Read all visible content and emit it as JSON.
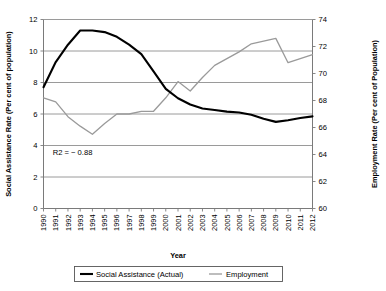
{
  "chart_data": {
    "type": "line",
    "title": "",
    "xlabel": "Year",
    "ylabel": "Social Assistance Rate (Per cent of population)",
    "y2label": "Employment Rate (Per cent of Population)",
    "categories": [
      "1990",
      "1991",
      "1992",
      "1993",
      "1994",
      "1995",
      "1996",
      "1997",
      "1998",
      "1999",
      "2000",
      "2001",
      "2002",
      "2003",
      "2004",
      "2005",
      "2006",
      "2007",
      "2008",
      "2009",
      "2010",
      "2011",
      "2012"
    ],
    "ylim": [
      0,
      12
    ],
    "yticks": [
      0,
      2,
      4,
      6,
      8,
      10,
      12
    ],
    "y2lim": [
      60,
      74
    ],
    "y2ticks": [
      60,
      62,
      64,
      66,
      68,
      70,
      72,
      74
    ],
    "grid": true,
    "legend_position": "bottom",
    "annotations": [
      {
        "text": "R2 = − 0.88",
        "x": "1991",
        "y": 3.6
      }
    ],
    "series": [
      {
        "name": "Social Assistance (Actual)",
        "axis": "left",
        "color": "#000000",
        "values": [
          7.7,
          9.3,
          10.4,
          11.3,
          11.3,
          11.2,
          10.9,
          10.4,
          9.8,
          8.7,
          7.6,
          7.0,
          6.6,
          6.35,
          6.25,
          6.15,
          6.1,
          5.95,
          5.7,
          5.5,
          5.6,
          5.75,
          5.85
        ]
      },
      {
        "name": "Employment",
        "axis": "right",
        "color": "#9a9a9a",
        "values": [
          68.2,
          67.9,
          66.8,
          66.1,
          65.5,
          66.3,
          67.0,
          67.0,
          67.2,
          67.2,
          68.2,
          69.4,
          68.7,
          69.7,
          70.6,
          71.1,
          71.6,
          72.2,
          72.4,
          72.6,
          70.8,
          71.1,
          71.4
        ]
      }
    ]
  },
  "legend": {
    "items": [
      {
        "label": "Social Assistance (Actual)"
      },
      {
        "label": "Employment"
      }
    ]
  }
}
